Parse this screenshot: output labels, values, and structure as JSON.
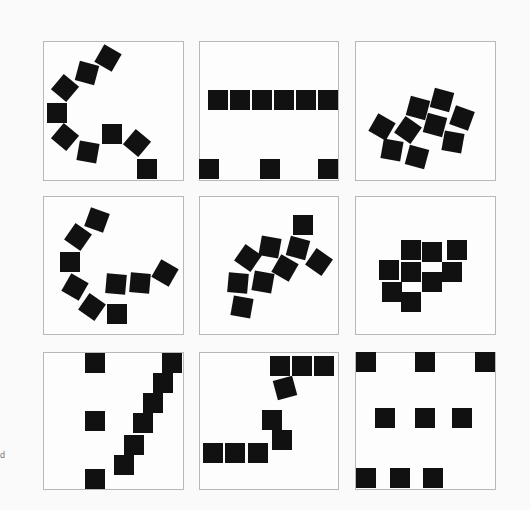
{
  "artwork": {
    "description": "3x3 grid of framed compositions of black squares",
    "edge_fragment_text": "d",
    "colors": {
      "background": "#fafafa",
      "frame": "#b8b8b8",
      "square": "#111111"
    },
    "square_size": 20,
    "panels": [
      {
        "id": "r1c1",
        "frame": [
          43,
          41,
          141,
          140
        ],
        "squares": [
          [
            108,
            58,
            30
          ],
          [
            87,
            73,
            15
          ],
          [
            65,
            88,
            40
          ],
          [
            57,
            113,
            0
          ],
          [
            65,
            137,
            40
          ],
          [
            88,
            152,
            10
          ],
          [
            112,
            134,
            0
          ],
          [
            137,
            143,
            40
          ],
          [
            147,
            169,
            0
          ]
        ]
      },
      {
        "id": "r1c2",
        "frame": [
          199,
          41,
          140,
          140
        ],
        "squares": [
          [
            218,
            100,
            0
          ],
          [
            240,
            100,
            0
          ],
          [
            262,
            100,
            0
          ],
          [
            284,
            100,
            0
          ],
          [
            306,
            100,
            0
          ],
          [
            328,
            100,
            0
          ],
          [
            209,
            169,
            0
          ],
          [
            270,
            169,
            0
          ],
          [
            328,
            169,
            0
          ]
        ]
      },
      {
        "id": "r1c3",
        "frame": [
          355,
          41,
          141,
          140
        ],
        "squares": [
          [
            382,
            127,
            30
          ],
          [
            392,
            150,
            10
          ],
          [
            408,
            130,
            35
          ],
          [
            418,
            108,
            15
          ],
          [
            417,
            157,
            15
          ],
          [
            435,
            125,
            15
          ],
          [
            442,
            100,
            15
          ],
          [
            462,
            118,
            20
          ],
          [
            453,
            142,
            10
          ]
        ]
      },
      {
        "id": "r2c1",
        "frame": [
          43,
          196,
          141,
          139
        ],
        "squares": [
          [
            97,
            220,
            20
          ],
          [
            78,
            237,
            35
          ],
          [
            70,
            262,
            0
          ],
          [
            75,
            287,
            30
          ],
          [
            92,
            307,
            35
          ],
          [
            117,
            314,
            0
          ],
          [
            116,
            284,
            5
          ],
          [
            140,
            283,
            5
          ],
          [
            165,
            273,
            30
          ]
        ]
      },
      {
        "id": "r2c2",
        "frame": [
          199,
          196,
          140,
          139
        ],
        "squares": [
          [
            303,
            225,
            0
          ],
          [
            298,
            248,
            15
          ],
          [
            319,
            262,
            35
          ],
          [
            270,
            247,
            10
          ],
          [
            248,
            258,
            35
          ],
          [
            285,
            268,
            30
          ],
          [
            263,
            282,
            10
          ],
          [
            238,
            283,
            5
          ],
          [
            242,
            307,
            10
          ]
        ]
      },
      {
        "id": "r2c3",
        "frame": [
          355,
          196,
          141,
          139
        ],
        "squares": [
          [
            411,
            250,
            0
          ],
          [
            432,
            252,
            0
          ],
          [
            457,
            250,
            0
          ],
          [
            389,
            270,
            0
          ],
          [
            411,
            272,
            0
          ],
          [
            432,
            282,
            0
          ],
          [
            452,
            272,
            0
          ],
          [
            392,
            292,
            0
          ],
          [
            411,
            302,
            0
          ]
        ]
      },
      {
        "id": "r3c1",
        "frame": [
          43,
          352,
          141,
          138
        ],
        "squares": [
          [
            95,
            363,
            0
          ],
          [
            95,
            421,
            0
          ],
          [
            95,
            479,
            0
          ],
          [
            172,
            363,
            0
          ],
          [
            163,
            383,
            0
          ],
          [
            153,
            403,
            0
          ],
          [
            143,
            423,
            0
          ],
          [
            134,
            445,
            0
          ],
          [
            124,
            465,
            0
          ]
        ]
      },
      {
        "id": "r3c2",
        "frame": [
          199,
          352,
          140,
          138
        ],
        "squares": [
          [
            280,
            366,
            0
          ],
          [
            302,
            366,
            0
          ],
          [
            324,
            366,
            0
          ],
          [
            285,
            388,
            -15
          ],
          [
            272,
            420,
            0
          ],
          [
            282,
            440,
            0
          ],
          [
            213,
            453,
            0
          ],
          [
            235,
            453,
            0
          ],
          [
            258,
            453,
            0
          ]
        ]
      },
      {
        "id": "r3c3",
        "frame": [
          355,
          352,
          141,
          138
        ],
        "squares": [
          [
            366,
            362,
            0
          ],
          [
            425,
            362,
            0
          ],
          [
            485,
            362,
            0
          ],
          [
            385,
            418,
            0
          ],
          [
            425,
            418,
            0
          ],
          [
            462,
            418,
            0
          ],
          [
            366,
            478,
            0
          ],
          [
            400,
            478,
            0
          ],
          [
            433,
            478,
            0
          ]
        ]
      }
    ]
  }
}
